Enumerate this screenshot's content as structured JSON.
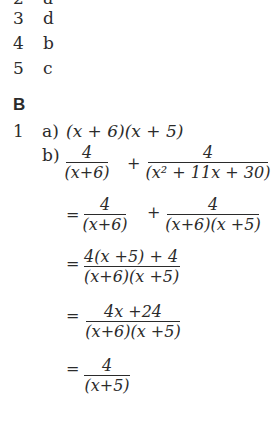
{
  "answers_a": [
    {
      "num": "2",
      "ans": "a"
    },
    {
      "num": "3",
      "ans": "d"
    },
    {
      "num": "4",
      "ans": "b"
    },
    {
      "num": "5",
      "ans": "c"
    }
  ],
  "section_b": {
    "heading": "B",
    "q1": {
      "number": "1",
      "a_label": "a)",
      "a_answer": "(x + 6)(x + 5)",
      "b_label": "b)",
      "b_frac1_num": "4",
      "b_frac1_den": "(x+6)",
      "b_plus": "+",
      "b_frac2_num": "4",
      "b_frac2_den": "(x² + 11x + 30)",
      "steps": [
        {
          "eq": "=",
          "f1_num": "4",
          "f1_den": "(x+6)",
          "plus": "+",
          "f2_num": "4",
          "f2_den": "(x+6)(x +5)"
        },
        {
          "eq": "=",
          "num": "4(x +5) + 4",
          "den": "(x+6)(x +5)"
        },
        {
          "eq": "=",
          "num": "4x +24",
          "den": "(x+6)(x +5)"
        },
        {
          "eq": "=",
          "num": "4",
          "den": "(x+5)"
        }
      ]
    }
  }
}
